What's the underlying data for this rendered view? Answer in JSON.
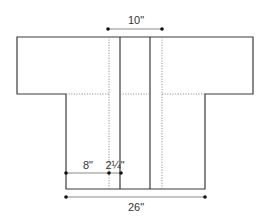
{
  "diagram": {
    "type": "garment-schematic",
    "shape": "t-shaped cardigan / kimono jacket, front view",
    "colors": {
      "outline": "#3a3a3a",
      "dotted": "#8a8a8a",
      "dimension_line": "#8a8a8a",
      "dimension_dot": "#111111",
      "text": "#333333"
    },
    "dimensions": {
      "top": {
        "label": "10\"",
        "description": "back neck width between dotted lines"
      },
      "left_panel": {
        "label": "8\"",
        "description": "front panel width"
      },
      "band": {
        "label": "2¼\"",
        "description": "front band width"
      },
      "bottom": {
        "label": "26\"",
        "description": "body width"
      }
    }
  }
}
